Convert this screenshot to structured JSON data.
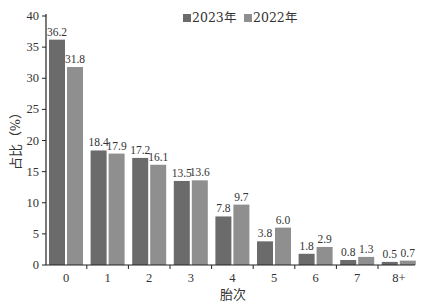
{
  "chart_data": {
    "type": "bar",
    "title": "",
    "xlabel": "胎次",
    "ylabel": "占比（%）",
    "ylim": [
      0,
      40
    ],
    "yticks": [
      0,
      5,
      10,
      15,
      20,
      25,
      30,
      35,
      40
    ],
    "grid": false,
    "legend_position": "top-center",
    "categories": [
      "0",
      "1",
      "2",
      "3",
      "4",
      "5",
      "6",
      "7",
      "8+"
    ],
    "series": [
      {
        "name": "2023年",
        "color": "#6b6b6b",
        "values": [
          36.2,
          18.4,
          17.2,
          13.5,
          7.8,
          3.8,
          1.8,
          0.8,
          0.5
        ]
      },
      {
        "name": "2022年",
        "color": "#8f8f8f",
        "values": [
          31.8,
          17.9,
          16.1,
          13.6,
          9.7,
          6.0,
          2.9,
          1.3,
          0.7
        ]
      }
    ],
    "value_labels": [
      [
        "36.2",
        "18.4",
        "17.2",
        "13.5",
        "7.8",
        "3.8",
        "1.8",
        "0.8",
        "0.5"
      ],
      [
        "31.8",
        "17.9",
        "16.1",
        "13.6",
        "9.7",
        "6.0",
        "2.9",
        "1.3",
        "0.7"
      ]
    ]
  }
}
